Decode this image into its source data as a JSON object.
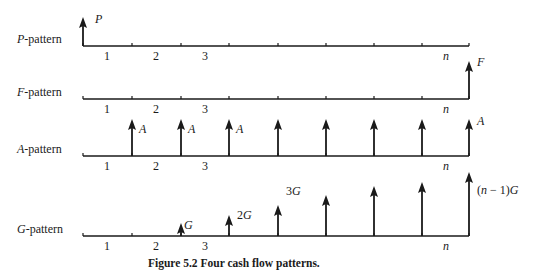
{
  "figure": {
    "caption": "Figure 5.2  Four cash flow patterns.",
    "axis": {
      "start_x": 83,
      "end_x": 469,
      "tick_x": [
        132,
        181,
        229,
        278,
        326,
        374,
        422
      ],
      "period_labels": [
        {
          "text": "1",
          "x": 107
        },
        {
          "text": "2",
          "x": 156
        },
        {
          "text": "3",
          "x": 205
        },
        {
          "text": "n",
          "x": 446
        }
      ]
    },
    "patterns": [
      {
        "name": "P-pattern",
        "label_var": "P",
        "label_suffix": "-pattern",
        "axis_y": 46,
        "arrows": [
          {
            "x": 83,
            "top": 17,
            "label": "P",
            "label_dx": 12,
            "label_dy": 6
          }
        ]
      },
      {
        "name": "F-pattern",
        "label_var": "F",
        "label_suffix": "-pattern",
        "axis_y": 99,
        "arrows": [
          {
            "x": 469,
            "top": 61,
            "label": "F",
            "label_dx": 8,
            "label_dy": 5
          }
        ]
      },
      {
        "name": "A-pattern",
        "label_var": "A",
        "label_suffix": "-pattern",
        "axis_y": 156,
        "arrows": [
          {
            "x": 132,
            "top": 119,
            "label": "A",
            "label_dx": 7,
            "label_dy": 14
          },
          {
            "x": 181,
            "top": 119,
            "label": "A",
            "label_dx": 7,
            "label_dy": 14
          },
          {
            "x": 229,
            "top": 119,
            "label": "A",
            "label_dx": 7,
            "label_dy": 14
          },
          {
            "x": 278,
            "top": 119,
            "label": ""
          },
          {
            "x": 326,
            "top": 119,
            "label": ""
          },
          {
            "x": 374,
            "top": 119,
            "label": ""
          },
          {
            "x": 422,
            "top": 119,
            "label": ""
          },
          {
            "x": 469,
            "top": 119,
            "label": "A",
            "label_dx": 8,
            "label_dy": 6
          }
        ]
      },
      {
        "name": "G-pattern",
        "label_var": "G",
        "label_suffix": "-pattern",
        "axis_y": 236,
        "arrows": [
          {
            "x": 181,
            "top": 223,
            "label": "G",
            "label_dx": 3,
            "label_dy": 6
          },
          {
            "x": 229,
            "top": 215,
            "label": "2G",
            "label_dx": 8,
            "label_dy": 4
          },
          {
            "x": 278,
            "top": 205,
            "label": "3G",
            "label_dx": 8,
            "label_dy": -10
          },
          {
            "x": 326,
            "top": 195,
            "label": ""
          },
          {
            "x": 374,
            "top": 186,
            "label": ""
          },
          {
            "x": 422,
            "top": 182,
            "label": ""
          },
          {
            "x": 469,
            "top": 172,
            "label": "(n − 1)G",
            "label_dx": 8,
            "label_dy": 22
          }
        ]
      }
    ]
  }
}
